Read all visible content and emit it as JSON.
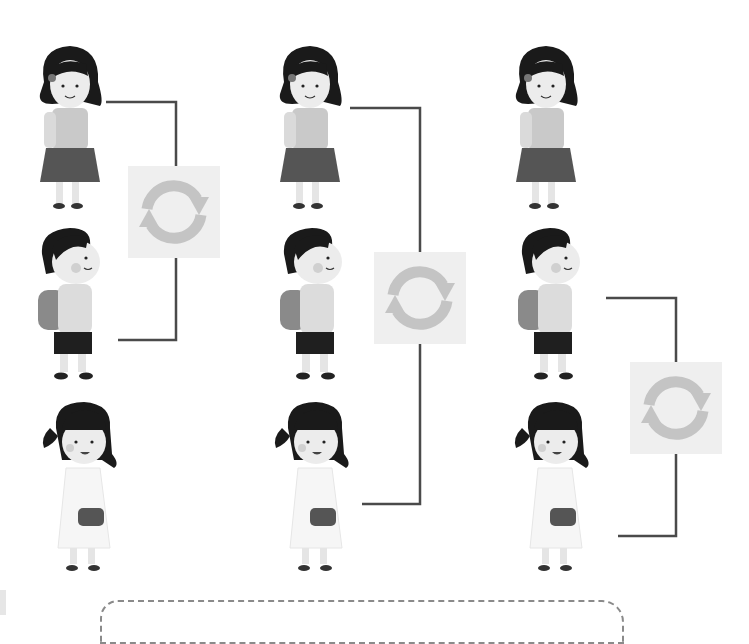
{
  "worksheet": {
    "title": "Swap the order",
    "colors": {
      "line": "#4a4a4a",
      "swap_box_bg": "#efefef",
      "swap_arrow": "#c4c4c4",
      "hair": "#1a1a1a",
      "skin": "#e8e8e8",
      "dress_dark": "#555555",
      "dashed_border": "#8a8a8a"
    },
    "columns": [
      {
        "id": "column-1",
        "children": [
          "girl-bob-hair",
          "boy-backpack",
          "girl-ponytail"
        ],
        "swap": {
          "between": [
            1,
            2
          ],
          "icon": "swap-cycle-icon"
        }
      },
      {
        "id": "column-2",
        "children": [
          "girl-bob-hair",
          "boy-backpack",
          "girl-ponytail"
        ],
        "swap": {
          "between": [
            1,
            3
          ],
          "icon": "swap-cycle-icon"
        }
      },
      {
        "id": "column-3",
        "children": [
          "girl-bob-hair",
          "boy-backpack",
          "girl-ponytail"
        ],
        "swap": {
          "between": [
            2,
            3
          ],
          "icon": "swap-cycle-icon"
        }
      }
    ],
    "answer_area": {
      "label": ""
    }
  }
}
